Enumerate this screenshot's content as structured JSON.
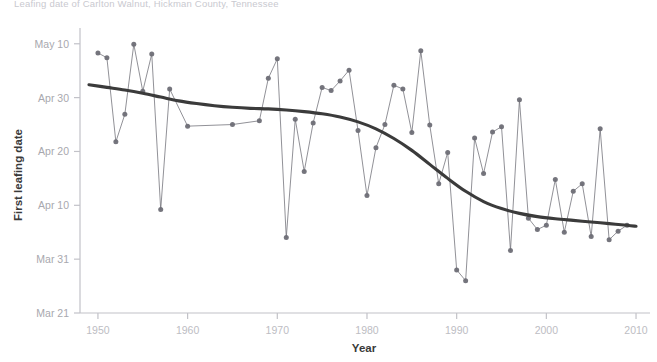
{
  "chart_data": {
    "type": "line",
    "title": "Leafing date of Carlton Walnut, Hickman County, Tennessee",
    "xlabel": "Year",
    "ylabel": "First leafing date",
    "xlim": [
      1948,
      2011
    ],
    "ylim_day_of_year": [
      80,
      132
    ],
    "xticks": [
      1950,
      1960,
      1970,
      1980,
      1990,
      2000,
      2010
    ],
    "ytick_labels": [
      "Mar 21",
      "Mar 31",
      "Apr 10",
      "Apr 20",
      "Apr 30",
      "May 10"
    ],
    "ytick_values": [
      80,
      90,
      100,
      110,
      120,
      130
    ],
    "grid": false,
    "legend": null,
    "series": [
      {
        "name": "First leafing date",
        "style": "line-with-markers",
        "color": "#6e6e76",
        "x": [
          1950,
          1951,
          1952,
          1953,
          1954,
          1955,
          1956,
          1957,
          1958,
          1960,
          1965,
          1968,
          1969,
          1970,
          1971,
          1972,
          1973,
          1974,
          1975,
          1976,
          1977,
          1978,
          1979,
          1980,
          1981,
          1982,
          1983,
          1984,
          1985,
          1986,
          1987,
          1988,
          1989,
          1990,
          1991,
          1992,
          1993,
          1994,
          1995,
          1996,
          1997,
          1998,
          1999,
          2000,
          2001,
          2002,
          2003,
          2004,
          2005,
          2006,
          2007,
          2008,
          2009
        ],
        "y": [
          128.3,
          127.4,
          111.8,
          116.9,
          129.9,
          121.2,
          128.1,
          99.2,
          121.6,
          114.7,
          115.0,
          115.7,
          123.6,
          127.2,
          94.0,
          116.0,
          106.3,
          115.3,
          121.9,
          121.3,
          123.1,
          125.1,
          113.9,
          101.8,
          110.7,
          115.0,
          122.3,
          121.6,
          113.5,
          128.7,
          114.9,
          104.0,
          109.8,
          88.0,
          86.0,
          112.5,
          105.9,
          113.6,
          114.6,
          91.6,
          119.6,
          97.6,
          95.5,
          96.3,
          104.8,
          95.0,
          102.6,
          104.0,
          94.2,
          114.2,
          93.6,
          95.2,
          96.3
        ]
      },
      {
        "name": "LOESS smoothed trend",
        "style": "smooth-line",
        "color": "#3b3b3b",
        "x": [
          1949,
          1951,
          1953,
          1955,
          1957,
          1959,
          1961,
          1963,
          1965,
          1967,
          1969,
          1971,
          1973,
          1975,
          1977,
          1979,
          1981,
          1983,
          1985,
          1987,
          1989,
          1991,
          1993,
          1995,
          1997,
          1999,
          2001,
          2003,
          2005,
          2007,
          2009,
          2010
        ],
        "y": [
          122.4,
          121.9,
          121.4,
          120.8,
          120.1,
          119.4,
          118.9,
          118.5,
          118.2,
          118.0,
          117.9,
          117.7,
          117.4,
          117.0,
          116.4,
          115.5,
          114.2,
          112.4,
          110.2,
          107.6,
          105.0,
          102.6,
          100.7,
          99.4,
          98.5,
          97.9,
          97.5,
          97.2,
          96.9,
          96.6,
          96.3,
          96.1
        ]
      }
    ]
  },
  "axis": {
    "y_title": "First leafing date",
    "x_title": "Year"
  }
}
